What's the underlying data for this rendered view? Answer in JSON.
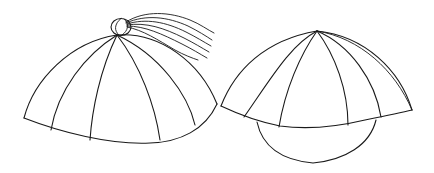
{
  "figure": {
    "items": [
      {
        "name": "skullcap-with-knob-and-tassel"
      },
      {
        "name": "cap-with-paneled-crown"
      }
    ],
    "colors": {
      "background": "#ffffff",
      "stroke": "#1a1a1a"
    }
  }
}
